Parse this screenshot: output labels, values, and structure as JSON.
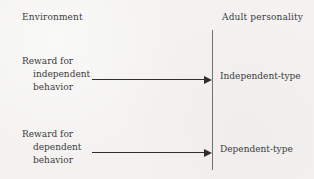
{
  "diagram": {
    "headers": {
      "left": "Environment",
      "right": "Adult personality"
    },
    "rows": [
      {
        "cause_line1": "Reward for",
        "cause_line2": "independent",
        "cause_line3": "behavior",
        "effect": "Independent-type"
      },
      {
        "cause_line1": "Reward for",
        "cause_line2": "dependent",
        "cause_line3": "behavior",
        "effect": "Dependent-type"
      }
    ],
    "colors": {
      "background": "#f3f2f0",
      "text": "#3b3b3c",
      "arrow": "#2f2f30",
      "divider": "#6f6f70"
    }
  }
}
